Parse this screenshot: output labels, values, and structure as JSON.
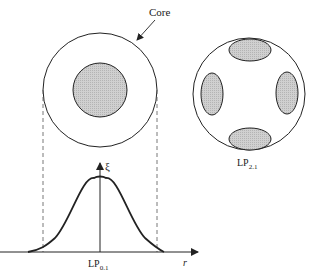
{
  "core_label": "Core",
  "mode_left": {
    "name": "LP",
    "sub": "0.1"
  },
  "mode_right": {
    "name": "LP",
    "sub": "2.1"
  },
  "y_axis_label": "ξ",
  "x_axis_label": "r",
  "colors": {
    "stroke": "#222222",
    "fill": "#c8c8c8",
    "dash": "#555555"
  }
}
